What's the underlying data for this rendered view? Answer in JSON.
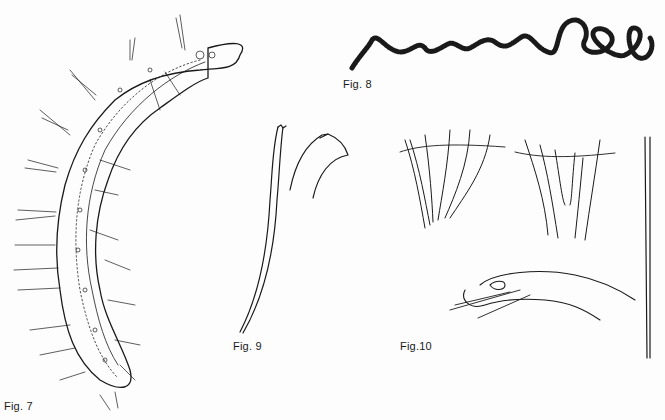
{
  "figures": [
    {
      "id": "fig7",
      "label": "Fig. 7",
      "subject": "elongate bristled worm body with dotted internal gut and setae along sides"
    },
    {
      "id": "fig8",
      "label": "Fig. 8",
      "subject": "long coiled segmented threadlike worm"
    },
    {
      "id": "fig9",
      "label": "Fig. 9",
      "subject": "two hooked chaetae (long shaft and curved hook tip)"
    },
    {
      "id": "fig10",
      "label": "Fig.10",
      "subject": "bundles of chaetae, a parapodium with protruding chaetae, and a single long straight chaeta with notched tip"
    }
  ],
  "colors": {
    "background": "#fdfdfd",
    "ink": "#1a1a1a"
  }
}
